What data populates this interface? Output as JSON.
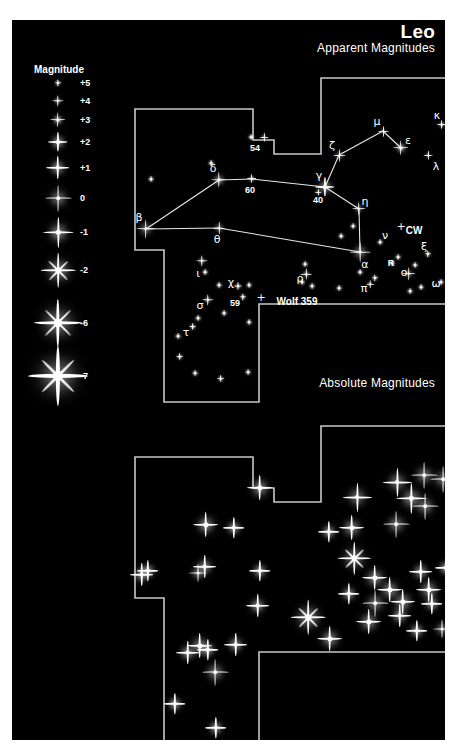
{
  "page": {
    "background": "#ffffff",
    "panel_background": "#000000",
    "star_color": "#ffffff",
    "boundary_color": "#c8c8c8",
    "constellation_line_color": "#e8e8e8"
  },
  "header": {
    "constellation": "Leo",
    "upper_chart_title": "Apparent Magnitudes",
    "lower_chart_title": "Absolute Magnitudes"
  },
  "legend": {
    "title": "Magnitude",
    "entries": [
      {
        "label": "+5",
        "x": 46,
        "y": 63,
        "mag": 5
      },
      {
        "label": "+4",
        "x": 46,
        "y": 81,
        "mag": 4
      },
      {
        "label": "+3",
        "x": 46,
        "y": 100,
        "mag": 3
      },
      {
        "label": "+2",
        "x": 46,
        "y": 122,
        "mag": 2
      },
      {
        "label": "+1",
        "x": 46,
        "y": 148,
        "mag": 1
      },
      {
        "label": "0",
        "x": 46,
        "y": 178,
        "mag": 0
      },
      {
        "label": "-1",
        "x": 46,
        "y": 212,
        "mag": -1
      },
      {
        "label": "-2",
        "x": 46,
        "y": 250,
        "mag": -2
      },
      {
        "label": "-6",
        "x": 46,
        "y": 303,
        "mag": -6
      },
      {
        "label": "-7",
        "x": 46,
        "y": 356,
        "mag": -7
      }
    ],
    "label_offset_x": 22
  },
  "chart_data": {
    "type": "scatter",
    "title": "Leo",
    "subtitle": "Apparent Magnitudes / Absolute Magnitudes",
    "xlabel": "",
    "ylabel": "",
    "grid": false,
    "legend_position": "left",
    "upper_panel": {
      "name": "Apparent Magnitudes",
      "boundary_path": "M 123,89 L 241,89 L 241,120 L 262,120 L 262,134 L 309,134 L 309,58 L 443,58 L 443,284 L 247,284 L 247,382 L 152,382 L 152,230 L 123,230 Z",
      "constellation_lines": [
        {
          "from": "beta",
          "to": "delta"
        },
        {
          "from": "beta",
          "to": "theta"
        },
        {
          "from": "delta",
          "to": "60"
        },
        {
          "from": "60",
          "to": "gamma"
        },
        {
          "from": "theta",
          "to": "alpha"
        },
        {
          "from": "gamma",
          "to": "zeta"
        },
        {
          "from": "zeta",
          "to": "mu"
        },
        {
          "from": "mu",
          "to": "epsilon"
        },
        {
          "from": "gamma",
          "to": "eta"
        },
        {
          "from": "eta",
          "to": "alpha"
        }
      ],
      "stars": [
        {
          "id": "alpha",
          "label": "α",
          "mag": 1.4,
          "x": 348,
          "y": 232,
          "lx": 353,
          "ly": 244,
          "greek": true
        },
        {
          "id": "beta",
          "label": "β",
          "mag": 2.1,
          "x": 134,
          "y": 209,
          "lx": 127,
          "ly": 197,
          "greek": true
        },
        {
          "id": "gamma",
          "label": "γ",
          "mag": 2.0,
          "x": 313,
          "y": 167,
          "lx": 307,
          "ly": 155,
          "greek": true
        },
        {
          "id": "delta",
          "label": "δ",
          "mag": 2.6,
          "x": 207,
          "y": 160,
          "lx": 201,
          "ly": 148,
          "greek": true
        },
        {
          "id": "epsilon",
          "label": "ε",
          "mag": 3.0,
          "x": 389,
          "y": 128,
          "lx": 396,
          "ly": 120,
          "greek": true
        },
        {
          "id": "zeta",
          "label": "ζ",
          "mag": 3.4,
          "x": 327,
          "y": 135,
          "lx": 320,
          "ly": 125,
          "greek": true
        },
        {
          "id": "eta",
          "label": "η",
          "mag": 3.5,
          "x": 347,
          "y": 189,
          "lx": 353,
          "ly": 181,
          "greek": true
        },
        {
          "id": "theta",
          "label": "θ",
          "mag": 3.3,
          "x": 207,
          "y": 208,
          "lx": 205,
          "ly": 219,
          "greek": true
        },
        {
          "id": "iota",
          "label": "ι",
          "mag": 4.0,
          "x": 190,
          "y": 241,
          "lx": 186,
          "ly": 253,
          "greek": true
        },
        {
          "id": "kappa",
          "label": "κ",
          "mag": 4.4,
          "x": 430,
          "y": 105,
          "lx": 425,
          "ly": 95,
          "greek": true
        },
        {
          "id": "lambda",
          "label": "λ",
          "mag": 4.3,
          "x": 416,
          "y": 135,
          "lx": 424,
          "ly": 146,
          "greek": true
        },
        {
          "id": "mu",
          "label": "μ",
          "mag": 3.9,
          "x": 371,
          "y": 111,
          "lx": 365,
          "ly": 101,
          "greek": true
        },
        {
          "id": "nu",
          "label": "ν",
          "mag": 5.3,
          "x": 368,
          "y": 222,
          "lx": 373,
          "ly": 215,
          "greek": true
        },
        {
          "id": "xi",
          "label": "ξ",
          "mag": 5.0,
          "x": 416,
          "y": 234,
          "lx": 412,
          "ly": 226,
          "greek": true
        },
        {
          "id": "omicron",
          "label": "ο",
          "mag": 3.5,
          "x": 397,
          "y": 254,
          "lx": 392,
          "ly": 252,
          "greek": true
        },
        {
          "id": "pi",
          "label": "π",
          "mag": 4.7,
          "x": 358,
          "y": 264,
          "lx": 352,
          "ly": 268,
          "greek": true
        },
        {
          "id": "rho",
          "label": "ρ",
          "mag": 3.8,
          "x": 294,
          "y": 254,
          "lx": 288,
          "ly": 258,
          "greek": true
        },
        {
          "id": "sigma",
          "label": "σ",
          "mag": 4.0,
          "x": 196,
          "y": 280,
          "lx": 188,
          "ly": 285,
          "greek": true
        },
        {
          "id": "tau",
          "label": "τ",
          "mag": 4.9,
          "x": 181,
          "y": 307,
          "lx": 174,
          "ly": 312,
          "greek": true
        },
        {
          "id": "chi",
          "label": "χ",
          "mag": 4.6,
          "x": 226,
          "y": 266,
          "lx": 219,
          "ly": 262,
          "greek": true
        },
        {
          "id": "omega",
          "label": "ω",
          "mag": 5.4,
          "x": 429,
          "y": 262,
          "lx": 424,
          "ly": 263,
          "greek": true
        },
        {
          "id": "54",
          "label": "54",
          "mag": 4.3,
          "x": 252,
          "y": 117,
          "lx": 243,
          "ly": 128,
          "greek": false
        },
        {
          "id": "60",
          "label": "60",
          "mag": 4.4,
          "x": 240,
          "y": 159,
          "lx": 238,
          "ly": 170,
          "greek": false
        },
        {
          "id": "59",
          "label": "59",
          "mag": 5.0,
          "x": 231,
          "y": 277,
          "lx": 223,
          "ly": 283,
          "greek": false
        },
        {
          "id": "40",
          "label": "40",
          "mag": 4.8,
          "x": 306,
          "y": 172,
          "lx": 306,
          "ly": 180,
          "greek": false
        },
        {
          "id": "R",
          "label": "R",
          "mag": 5.8,
          "x": 386,
          "y": 237,
          "lx": 379,
          "ly": 243,
          "greek": false
        },
        {
          "id": "CW",
          "label": "CW",
          "mag": 6.0,
          "x": 389,
          "y": 206,
          "lx": 402,
          "ly": 210,
          "greek": false,
          "cross": true
        },
        {
          "id": "Wolf359",
          "label": "Wolf 359",
          "mag": 6.2,
          "x": 249,
          "y": 277,
          "lx": 285,
          "ly": 281,
          "greek": false,
          "cross": true
        }
      ],
      "field_stars": [
        {
          "x": 139,
          "y": 159,
          "mag": 5.2
        },
        {
          "x": 199,
          "y": 143,
          "mag": 5.2
        },
        {
          "x": 239,
          "y": 117,
          "mag": 5.6
        },
        {
          "x": 341,
          "y": 206,
          "mag": 5.6
        },
        {
          "x": 193,
          "y": 252,
          "mag": 5.8
        },
        {
          "x": 207,
          "y": 265,
          "mag": 5.8
        },
        {
          "x": 237,
          "y": 265,
          "mag": 5.6
        },
        {
          "x": 293,
          "y": 244,
          "mag": 5.2
        },
        {
          "x": 300,
          "y": 266,
          "mag": 5.4
        },
        {
          "x": 327,
          "y": 268,
          "mag": 5.8
        },
        {
          "x": 363,
          "y": 258,
          "mag": 5.0
        },
        {
          "x": 409,
          "y": 267,
          "mag": 5.4
        },
        {
          "x": 398,
          "y": 271,
          "mag": 5.6
        },
        {
          "x": 403,
          "y": 245,
          "mag": 5.6
        },
        {
          "x": 380,
          "y": 243,
          "mag": 5.4
        },
        {
          "x": 186,
          "y": 298,
          "mag": 5.6
        },
        {
          "x": 212,
          "y": 293,
          "mag": 5.6
        },
        {
          "x": 237,
          "y": 302,
          "mag": 5.2
        },
        {
          "x": 168,
          "y": 337,
          "mag": 4.9
        },
        {
          "x": 183,
          "y": 353,
          "mag": 5.4
        },
        {
          "x": 209,
          "y": 359,
          "mag": 4.9
        },
        {
          "x": 236,
          "y": 352,
          "mag": 5.2
        },
        {
          "x": 166,
          "y": 316,
          "mag": 5.8
        },
        {
          "x": 290,
          "y": 262,
          "mag": 5.8
        },
        {
          "x": 348,
          "y": 252,
          "mag": 5.7
        },
        {
          "x": 329,
          "y": 216,
          "mag": 5.9
        }
      ]
    },
    "lower_panel": {
      "name": "Absolute Magnitudes",
      "boundary_path": "M 123,437 L 241,437 L 241,468 L 262,468 L 262,482 L 309,482 L 309,406 L 443,406 L 443,632 L 247,632 L 247,730 L 152,730 L 152,578 L 123,578 Z",
      "stars": [
        {
          "x": 248,
          "y": 468,
          "mag": 0.5
        },
        {
          "x": 385,
          "y": 462,
          "mag": -0.5
        },
        {
          "x": 412,
          "y": 455,
          "mag": 0.0
        },
        {
          "x": 431,
          "y": 459,
          "mag": 0.0
        },
        {
          "x": 345,
          "y": 477,
          "mag": -0.5
        },
        {
          "x": 399,
          "y": 478,
          "mag": -1.0
        },
        {
          "x": 194,
          "y": 505,
          "mag": 0.5
        },
        {
          "x": 222,
          "y": 508,
          "mag": 1.5
        },
        {
          "x": 340,
          "y": 508,
          "mag": 0.5
        },
        {
          "x": 384,
          "y": 504,
          "mag": 0.0
        },
        {
          "x": 413,
          "y": 486,
          "mag": 0.0
        },
        {
          "x": 317,
          "y": 512,
          "mag": 1.5
        },
        {
          "x": 136,
          "y": 551,
          "mag": 1.5
        },
        {
          "x": 193,
          "y": 547,
          "mag": 1.0
        },
        {
          "x": 342,
          "y": 538,
          "mag": -1.5
        },
        {
          "x": 363,
          "y": 558,
          "mag": 0.5
        },
        {
          "x": 409,
          "y": 552,
          "mag": 1.0
        },
        {
          "x": 378,
          "y": 570,
          "mag": 0.5
        },
        {
          "x": 434,
          "y": 548,
          "mag": 1.5
        },
        {
          "x": 417,
          "y": 570,
          "mag": 0.5
        },
        {
          "x": 337,
          "y": 574,
          "mag": 1.5
        },
        {
          "x": 130,
          "y": 555,
          "mag": 1.0
        },
        {
          "x": 186,
          "y": 553,
          "mag": 1.8
        },
        {
          "x": 296,
          "y": 597,
          "mag": -2.0
        },
        {
          "x": 363,
          "y": 583,
          "mag": 0.0
        },
        {
          "x": 391,
          "y": 582,
          "mag": 0.5
        },
        {
          "x": 388,
          "y": 596,
          "mag": 1.0
        },
        {
          "x": 420,
          "y": 584,
          "mag": 1.5
        },
        {
          "x": 357,
          "y": 602,
          "mag": 0.5
        },
        {
          "x": 405,
          "y": 611,
          "mag": 1.5
        },
        {
          "x": 246,
          "y": 586,
          "mag": 1.0
        },
        {
          "x": 188,
          "y": 626,
          "mag": 0.5
        },
        {
          "x": 196,
          "y": 630,
          "mag": 1.5
        },
        {
          "x": 176,
          "y": 633,
          "mag": 1.0
        },
        {
          "x": 224,
          "y": 625,
          "mag": 1.0
        },
        {
          "x": 203,
          "y": 652,
          "mag": 0.0
        },
        {
          "x": 163,
          "y": 684,
          "mag": 1.5
        },
        {
          "x": 204,
          "y": 708,
          "mag": 1.5
        },
        {
          "x": 318,
          "y": 619,
          "mag": 0.5
        },
        {
          "x": 430,
          "y": 609,
          "mag": 1.8
        },
        {
          "x": 248,
          "y": 551,
          "mag": 1.5
        }
      ]
    }
  }
}
